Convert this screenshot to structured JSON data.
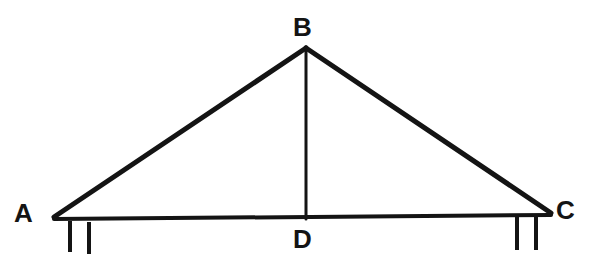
{
  "diagram": {
    "background_color": "#ffffff",
    "stroke_color": "#141414",
    "canvas": {
      "width": 593,
      "height": 267
    },
    "labels": {
      "a": "A",
      "b": "B",
      "c": "C",
      "d": "D"
    },
    "points": {
      "A": {
        "x": 54,
        "y": 217
      },
      "B": {
        "x": 306,
        "y": 48
      },
      "C": {
        "x": 551,
        "y": 213
      },
      "D": {
        "x": 306,
        "y": 219
      }
    },
    "segments": [
      {
        "name": "side-ab",
        "from": "A",
        "to": "B",
        "width": 5
      },
      {
        "name": "side-bc",
        "from": "B",
        "to": "C",
        "width": 5
      },
      {
        "name": "base-ac",
        "from": "A",
        "to": "C",
        "width": 4
      },
      {
        "name": "altitude-bd",
        "from": "B",
        "to": "D",
        "width": 3
      }
    ],
    "hatch_marks": [
      {
        "name": "hatch-a-1",
        "x1": 70,
        "y1": 221,
        "x2": 70,
        "y2": 252,
        "width": 4
      },
      {
        "name": "hatch-a-2",
        "x1": 89,
        "y1": 222,
        "x2": 89,
        "y2": 254,
        "width": 4
      },
      {
        "name": "hatch-c-1",
        "x1": 517,
        "y1": 217,
        "x2": 517,
        "y2": 250,
        "width": 4
      },
      {
        "name": "hatch-c-2",
        "x1": 536,
        "y1": 217,
        "x2": 536,
        "y2": 250,
        "width": 4
      }
    ]
  }
}
